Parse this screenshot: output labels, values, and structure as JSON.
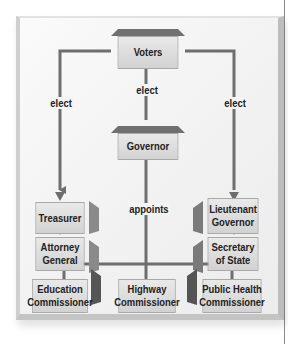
{
  "diagram": {
    "nodes": {
      "voters": "Voters",
      "governor": "Governor",
      "treasurer": "Treasurer",
      "attorney_general_1": "Attorney",
      "attorney_general_2": "General",
      "lieutenant_governor_1": "Lieutenant",
      "lieutenant_governor_2": "Governor",
      "secretary_of_state_1": "Secretary",
      "secretary_of_state_2": "of State",
      "education_commissioner_1": "Education",
      "education_commissioner_2": "Commissioner",
      "highway_commissioner_1": "Highway",
      "highway_commissioner_2": "Commissioner",
      "public_health_commissioner_1": "Public Health",
      "public_health_commissioner_2": "Commissioner"
    },
    "edge_labels": {
      "elect_left": "elect",
      "elect_center": "elect",
      "elect_right": "elect",
      "appoints": "appoints"
    },
    "colors": {
      "line": "#6e6e6e",
      "box_light": "#e9e9e9",
      "box_dark": "#d2d2d2",
      "bevel": "#707070"
    }
  }
}
